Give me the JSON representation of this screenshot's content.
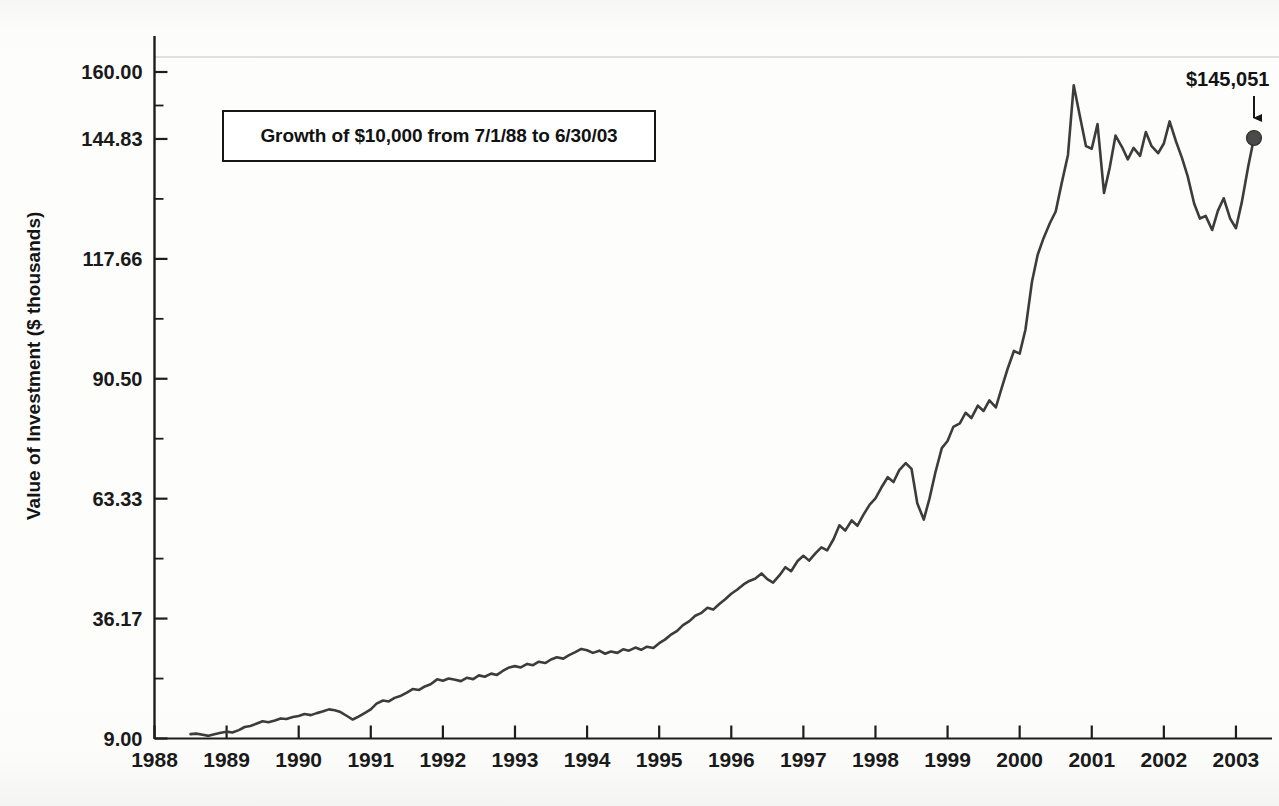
{
  "chart_data": {
    "type": "line",
    "title": "Growth of $10,000 from 7/1/88 to 6/30/03",
    "xlabel": "",
    "ylabel": "Value of Investment ($ thousands)",
    "xlim": [
      1988.0,
      2003.5
    ],
    "ylim": [
      9.0,
      160.0
    ],
    "grid": false,
    "legend": "none",
    "y_tick_labels": [
      "160.00",
      "144.83",
      "117.66",
      "90.50",
      "63.33",
      "36.17",
      "9.00"
    ],
    "y_tick_values": [
      160.0,
      144.83,
      117.66,
      90.5,
      63.33,
      36.17,
      9.0
    ],
    "y_minor_tick_values": [
      152.41,
      131.25,
      104.08,
      76.92,
      49.75,
      22.58
    ],
    "x_tick_labels": [
      "1988",
      "1989",
      "1990",
      "1991",
      "1992",
      "1993",
      "1994",
      "1995",
      "1996",
      "1997",
      "1998",
      "1999",
      "2000",
      "2001",
      "2002",
      "2003"
    ],
    "x_tick_values": [
      1988,
      1989,
      1990,
      1991,
      1992,
      1993,
      1994,
      1995,
      1996,
      1997,
      1998,
      1999,
      2000,
      2001,
      2002,
      2003
    ],
    "annotations": [
      {
        "text": "$145,051",
        "x": 2003.25,
        "y": 145.051,
        "marker": "dot",
        "arrow": "down"
      }
    ],
    "series": [
      {
        "name": "Value of Investment",
        "color": "#3c3c3c",
        "line_width": 2.6,
        "x": [
          1988.5,
          1988.58,
          1988.67,
          1988.75,
          1988.83,
          1988.92,
          1989.0,
          1989.08,
          1989.17,
          1989.25,
          1989.33,
          1989.42,
          1989.5,
          1989.58,
          1989.67,
          1989.75,
          1989.83,
          1989.92,
          1990.0,
          1990.08,
          1990.17,
          1990.25,
          1990.33,
          1990.42,
          1990.5,
          1990.58,
          1990.67,
          1990.75,
          1990.83,
          1990.92,
          1991.0,
          1991.08,
          1991.17,
          1991.25,
          1991.33,
          1991.42,
          1991.5,
          1991.58,
          1991.67,
          1991.75,
          1991.83,
          1991.92,
          1992.0,
          1992.08,
          1992.17,
          1992.25,
          1992.33,
          1992.42,
          1992.5,
          1992.58,
          1992.67,
          1992.75,
          1992.83,
          1992.92,
          1993.0,
          1993.08,
          1993.17,
          1993.25,
          1993.33,
          1993.42,
          1993.5,
          1993.58,
          1993.67,
          1993.75,
          1993.83,
          1993.92,
          1994.0,
          1994.08,
          1994.17,
          1994.25,
          1994.33,
          1994.42,
          1994.5,
          1994.58,
          1994.67,
          1994.75,
          1994.83,
          1994.92,
          1995.0,
          1995.08,
          1995.17,
          1995.25,
          1995.33,
          1995.42,
          1995.5,
          1995.58,
          1995.67,
          1995.75,
          1995.83,
          1995.92,
          1996.0,
          1996.08,
          1996.17,
          1996.25,
          1996.33,
          1996.42,
          1996.5,
          1996.58,
          1996.67,
          1996.75,
          1996.83,
          1996.92,
          1997.0,
          1997.08,
          1997.17,
          1997.25,
          1997.33,
          1997.42,
          1997.5,
          1997.58,
          1997.67,
          1997.75,
          1997.83,
          1997.92,
          1998.0,
          1998.08,
          1998.17,
          1998.25,
          1998.33,
          1998.42,
          1998.5,
          1998.58,
          1998.67,
          1998.75,
          1998.83,
          1998.92,
          1999.0,
          1999.08,
          1999.17,
          1999.25,
          1999.33,
          1999.42,
          1999.5,
          1999.58,
          1999.67,
          1999.75,
          1999.83,
          1999.92,
          2000.0,
          2000.08,
          2000.17,
          2000.25,
          2000.33,
          2000.42,
          2000.5,
          2000.58,
          2000.67,
          2000.75,
          2000.83,
          2000.92,
          2001.0,
          2001.08,
          2001.17,
          2001.25,
          2001.33,
          2001.42,
          2001.5,
          2001.58,
          2001.67,
          2001.75,
          2001.83,
          2001.92,
          2002.0,
          2002.08,
          2002.17,
          2002.25,
          2002.33,
          2002.42,
          2002.5,
          2002.58,
          2002.67,
          2002.75,
          2002.83,
          2002.92,
          2003.0,
          2003.08,
          2003.17,
          2003.25
        ],
        "y": [
          10.0,
          10.1,
          9.85,
          9.6,
          9.95,
          10.3,
          10.55,
          10.35,
          10.9,
          11.6,
          11.85,
          12.4,
          12.9,
          12.7,
          13.1,
          13.55,
          13.4,
          13.85,
          14.1,
          14.55,
          14.3,
          14.75,
          15.1,
          15.6,
          15.4,
          15.0,
          14.1,
          13.3,
          13.95,
          14.8,
          15.6,
          16.9,
          17.6,
          17.4,
          18.2,
          18.7,
          19.4,
          20.2,
          20.0,
          20.8,
          21.3,
          22.4,
          22.1,
          22.6,
          22.3,
          22.0,
          22.75,
          22.45,
          23.3,
          23.0,
          23.7,
          23.4,
          24.3,
          25.1,
          25.4,
          25.1,
          25.9,
          25.6,
          26.4,
          26.1,
          26.9,
          27.4,
          27.1,
          27.9,
          28.5,
          29.3,
          29.0,
          28.4,
          28.9,
          28.2,
          28.7,
          28.4,
          29.2,
          28.9,
          29.6,
          29.1,
          29.8,
          29.5,
          30.6,
          31.4,
          32.6,
          33.4,
          34.7,
          35.6,
          36.8,
          37.4,
          38.6,
          38.2,
          39.4,
          40.6,
          41.8,
          42.7,
          43.9,
          44.7,
          45.2,
          46.4,
          45.1,
          44.3,
          46.0,
          47.8,
          46.9,
          49.2,
          50.4,
          49.3,
          51.0,
          52.3,
          51.6,
          54.2,
          57.3,
          56.1,
          58.4,
          57.2,
          59.6,
          62.0,
          63.4,
          65.8,
          68.2,
          67.1,
          69.8,
          71.4,
          70.1,
          62.3,
          58.6,
          63.4,
          69.2,
          74.8,
          76.4,
          79.6,
          80.4,
          82.8,
          81.6,
          84.4,
          83.2,
          85.6,
          84.0,
          88.4,
          92.6,
          96.8,
          96.2,
          101.6,
          112.4,
          118.6,
          122.3,
          125.8,
          128.4,
          134.6,
          141.2,
          157.0,
          150.4,
          143.2,
          142.6,
          148.2,
          132.6,
          138.4,
          145.6,
          143.0,
          140.2,
          142.8,
          141.0,
          146.4,
          143.2,
          141.6,
          143.8,
          148.8,
          144.2,
          140.6,
          136.4,
          130.2,
          126.8,
          127.4,
          124.2,
          128.6,
          131.4,
          126.8,
          124.6,
          130.4,
          138.6,
          145.05
        ]
      }
    ]
  },
  "axis": {
    "y_title": "Value of Investment ($ thousands)"
  },
  "title_box": {
    "text": "Growth of $10,000 from 7/1/88 to 6/30/03"
  },
  "end_label": {
    "text": "$145,051"
  }
}
